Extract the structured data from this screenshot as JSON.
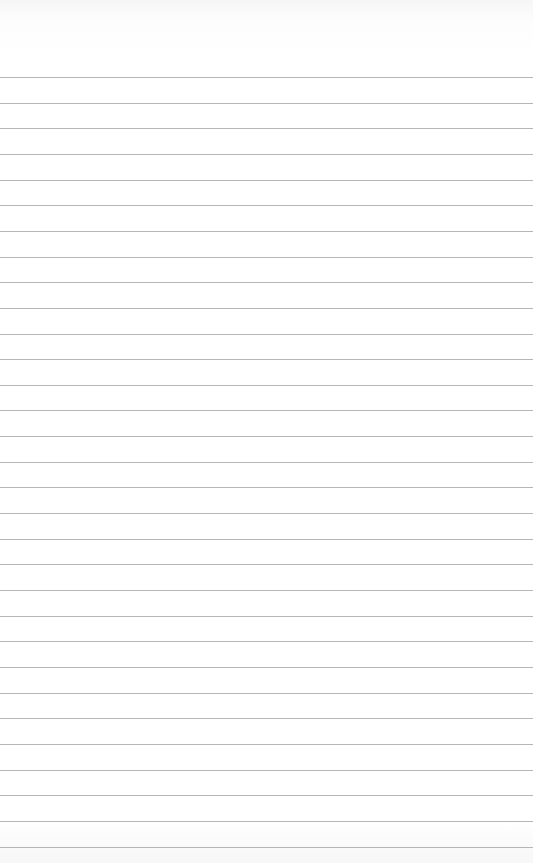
{
  "page": {
    "type": "blank lined paper",
    "line_count": 31,
    "first_line_y": 77,
    "line_spacing": 25.65,
    "line_color": "#a9a9a9",
    "background_color": "#ffffff"
  }
}
